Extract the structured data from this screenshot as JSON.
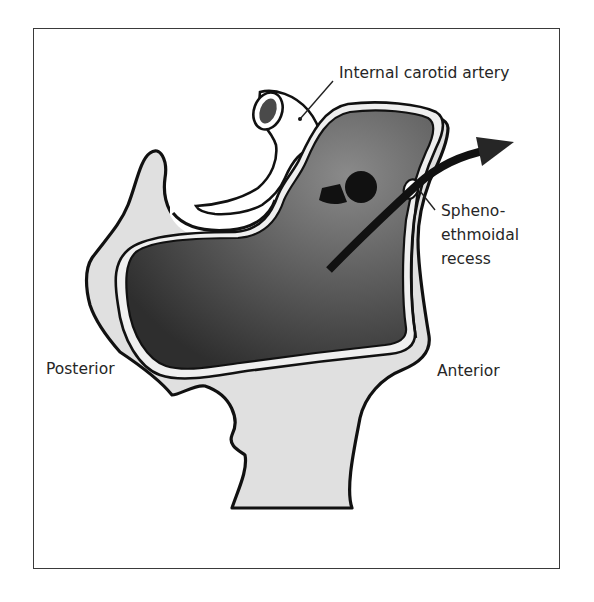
{
  "figure": {
    "colors": {
      "bone": "#e2e2e2",
      "sinus_dark": "#3c3c3c",
      "sinus_light": "#8c8c8c",
      "outline": "#111111",
      "mucosa": "#f2f2f2",
      "artery_lumen": "#4a4a4a"
    }
  },
  "labels": {
    "internal_carotid": "Internal carotid artery",
    "sphenoethmoidal": "Spheno-\nethmoidal\nrecess",
    "posterior": "Posterior",
    "anterior": "Anterior"
  }
}
